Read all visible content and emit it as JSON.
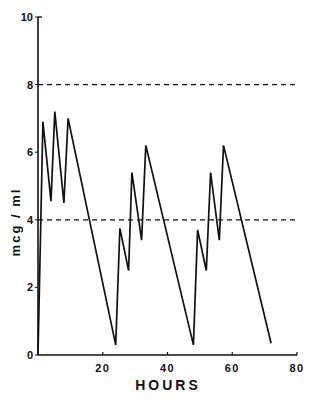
{
  "chart_data": {
    "type": "line",
    "title": "",
    "xlabel": "HOURS",
    "ylabel": "mcg / ml",
    "xlim": [
      0,
      80
    ],
    "ylim": [
      0,
      10
    ],
    "x_ticks": [
      20,
      40,
      60,
      80
    ],
    "x_tick_labels": [
      "20",
      "40",
      "60",
      "80"
    ],
    "y_ticks": [
      0,
      2,
      4,
      6,
      8,
      10
    ],
    "y_tick_labels": [
      "0",
      "2",
      "4",
      "6",
      "8",
      "10"
    ],
    "grid": false,
    "legend": null,
    "series": [
      {
        "name": "serum concentration",
        "x": [
          0,
          1.5,
          4,
          5.2,
          8,
          9.3,
          24,
          25.3,
          28,
          29,
          32,
          33.3,
          48,
          49.3,
          52,
          53.3,
          56,
          57.3,
          72
        ],
        "y": [
          0,
          6.9,
          4.55,
          7.2,
          4.5,
          7.0,
          0.3,
          3.75,
          2.5,
          5.4,
          3.4,
          6.2,
          0.3,
          3.7,
          2.5,
          5.4,
          3.4,
          6.2,
          0.35
        ]
      }
    ],
    "reference_lines": [
      {
        "axis": "y",
        "value": 8,
        "style": "dashed"
      },
      {
        "axis": "y",
        "value": 4,
        "style": "dashed"
      }
    ]
  }
}
